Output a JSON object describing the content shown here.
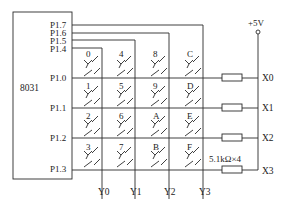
{
  "diagram": {
    "chip_label": "8031",
    "ports": [
      "P1.7",
      "P1.6",
      "P1.5",
      "P1.4",
      "P1.0",
      "P1.1",
      "P1.2",
      "P1.3"
    ],
    "rows": [
      "P1.0",
      "P1.1",
      "P1.2",
      "P1.3"
    ],
    "columns": [
      "P1.4",
      "P1.5",
      "P1.6",
      "P1.7"
    ],
    "keys": [
      [
        "0",
        "4",
        "8",
        "C"
      ],
      [
        "1",
        "5",
        "9",
        "D"
      ],
      [
        "2",
        "6",
        "A",
        "E"
      ],
      [
        "3",
        "7",
        "B",
        "F"
      ]
    ],
    "row_outputs": [
      "X0",
      "X1",
      "X2",
      "X3"
    ],
    "column_outputs": [
      "Y0",
      "Y1",
      "Y2",
      "Y3"
    ],
    "supply": "+5V",
    "resistor_label": "5.1kΩ×4"
  }
}
